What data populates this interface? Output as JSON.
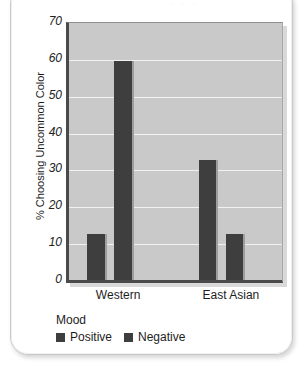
{
  "card": {
    "caption_remnant": "· ·   ·"
  },
  "chart_data": {
    "type": "bar",
    "title": "",
    "xlabel": "",
    "ylabel": "% Choosing Uncommon Color",
    "ylim": [
      0,
      70
    ],
    "yticks": [
      70,
      60,
      50,
      40,
      30,
      20,
      10,
      0
    ],
    "grid": true,
    "categories": [
      "Western",
      "East Asian"
    ],
    "legend_title": "Mood",
    "legend_position": "bottom-left",
    "series": [
      {
        "name": "Positive",
        "values": [
          12.5,
          32.5
        ],
        "color": "#3e3e3e"
      },
      {
        "name": "Negative",
        "values": [
          59.5,
          12.5
        ],
        "color": "#3e3e3e"
      }
    ],
    "bars": [
      {
        "group": "Western",
        "series": "Positive",
        "value": 12.5,
        "left_pct": 8.5,
        "width_pct": 8.3
      },
      {
        "group": "Western",
        "series": "Negative",
        "value": 59.5,
        "left_pct": 21.2,
        "width_pct": 8.3
      },
      {
        "group": "East Asian",
        "series": "Positive",
        "value": 32.5,
        "left_pct": 60.8,
        "width_pct": 8.3
      },
      {
        "group": "East Asian",
        "series": "Negative",
        "value": 12.5,
        "left_pct": 73.6,
        "width_pct": 8.3
      }
    ],
    "group_label_centers_pct": [
      24.0,
      76.0
    ],
    "plot_bg": "#c9c9c9",
    "gridline_color": "#f2f2f2"
  }
}
